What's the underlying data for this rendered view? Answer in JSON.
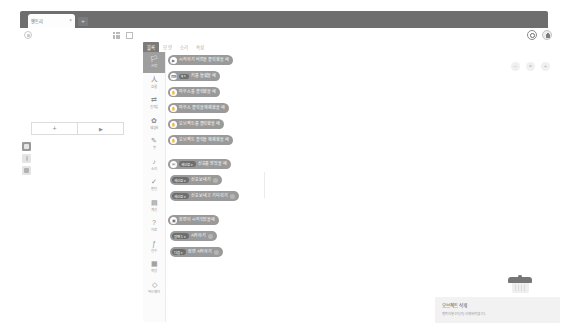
{
  "browser": {
    "tab_title": "엔트리",
    "tab_close_glyph": "×",
    "new_tab_glyph": "+"
  },
  "header": {
    "home_icon": "home-icon",
    "grid_icon": "grid-icon",
    "expand_icon": "expand-icon",
    "record_label": "record-button",
    "lock_label": "lock-button"
  },
  "stage": {
    "add_object_label": "+",
    "play_label": "▶",
    "tools": [
      {
        "name": "cursor-tool",
        "active": true
      },
      {
        "name": "pointer-tool",
        "active": false
      },
      {
        "name": "frame-tool",
        "active": false
      }
    ]
  },
  "editor": {
    "tabs": [
      {
        "label": "블록",
        "active": true
      },
      {
        "label": "모양",
        "active": false
      },
      {
        "label": "소리",
        "active": false
      },
      {
        "label": "속성",
        "active": false
      }
    ],
    "zoom_controls": [
      "−",
      "=",
      "+"
    ],
    "categories": [
      {
        "icon": "🏳",
        "label": "시작",
        "active": true
      },
      {
        "icon": "人",
        "label": "흐름",
        "active": false
      },
      {
        "icon": "⇄",
        "label": "움직임",
        "active": false
      },
      {
        "icon": "✿",
        "label": "생김새",
        "active": false
      },
      {
        "icon": "✎",
        "label": "붓",
        "active": false
      },
      {
        "icon": "♪",
        "label": "소리",
        "active": false
      },
      {
        "icon": "✓",
        "label": "판단",
        "active": false
      },
      {
        "icon": "▤",
        "label": "계산",
        "active": false
      },
      {
        "icon": "?",
        "label": "자료",
        "active": false
      },
      {
        "icon": "ƒ",
        "label": "함수",
        "active": false
      },
      {
        "icon": "▦",
        "label": "확장",
        "active": false
      },
      {
        "icon": "◇",
        "label": "하드웨어",
        "active": false
      }
    ],
    "blocks": [
      {
        "kind": "hat",
        "icon": "▶",
        "text": "시작하기 버튼을 클릭했을 때",
        "top": 3
      },
      {
        "kind": "hat",
        "icon": "⌨",
        "dropdown": "q",
        "text": "키를 눌렀을 때",
        "top": 19
      },
      {
        "kind": "hat",
        "icon": "✋",
        "text": "마우스를 클릭했을 때",
        "top": 35
      },
      {
        "kind": "hat",
        "icon": "✋",
        "text": "마우스 클릭을 해제했을 때",
        "top": 51
      },
      {
        "kind": "hat",
        "icon": "✋",
        "text": "오브젝트를 클릭했을 때",
        "top": 67
      },
      {
        "kind": "hat",
        "icon": "✋",
        "text": "오브젝트 클릭을 해제했을 때",
        "top": 83
      },
      {
        "kind": "hat",
        "icon": "✉",
        "dropdown": "새신호",
        "text": "신호를 받았을 때",
        "top": 107
      },
      {
        "kind": "stack",
        "dropdown": "새신호",
        "text": "신호 보내기",
        "end": true,
        "top": 123
      },
      {
        "kind": "stack",
        "dropdown": "새신호",
        "text": "신호 보내고 기다리기",
        "end": true,
        "top": 139
      },
      {
        "kind": "hat",
        "icon": "▣",
        "text": "장면이 시작되었을때",
        "top": 163
      },
      {
        "kind": "stack",
        "dropdown": "장면 1",
        "text": "시작하기",
        "end": true,
        "top": 179
      },
      {
        "kind": "stack",
        "dropdown": "다음",
        "text": "장면 시작하기",
        "end": true,
        "top": 195
      }
    ]
  },
  "toast": {
    "title": "오브젝트 삭제",
    "description": "엔트리봇 1이(가) 삭제되었습니다."
  },
  "trash": {
    "name": "trash-can"
  }
}
